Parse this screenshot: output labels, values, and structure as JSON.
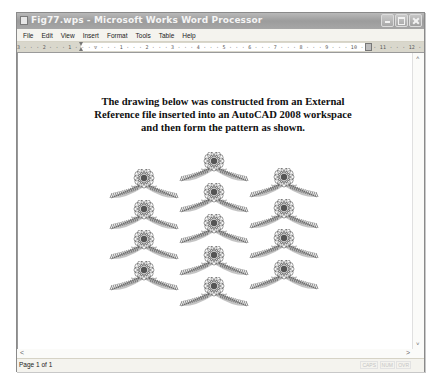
{
  "window": {
    "title": "Fig77.wps - Microsoft Works Word Processor",
    "controls": {
      "minimize": "minimize",
      "maximize": "maximize",
      "close": "close"
    }
  },
  "menu": {
    "items": [
      "File",
      "Edit",
      "View",
      "Insert",
      "Format",
      "Tools",
      "Table",
      "Help"
    ]
  },
  "ruler": {
    "marks": "3 · · · 2 · · · 1 · · · ▽ · · · 1 · · · 2 · · · 3 · · · 4 · · · 5 · · · 6 · · · 7 · · · 8 · · · 9 · · · 10 · · · 11 · · · 12 · · · 13 · · · 14 · ▲ · 15 · · 17"
  },
  "document": {
    "lines": [
      "The drawing below was constructed from an External",
      "Reference file inserted into an AutoCAD 2008 workspace",
      "and then form the pattern as shown."
    ],
    "figure": {
      "description": "Pattern of flower-and-feather motifs arranged in 3 columns",
      "columns": [
        {
          "name": "left",
          "count": 4
        },
        {
          "name": "middle",
          "count": 5
        },
        {
          "name": "right",
          "count": 4
        }
      ]
    }
  },
  "scrollbars": {
    "up": "˄",
    "down": "˅",
    "left": "<",
    "right": ">"
  },
  "status": {
    "page": "Page 1 of 1",
    "indicators": [
      "CAPS",
      "NUM",
      "OVR"
    ]
  },
  "colors": {
    "titlebar": "#a6a6a6",
    "menubar": "#f4f3ee",
    "motif": "#555555"
  }
}
